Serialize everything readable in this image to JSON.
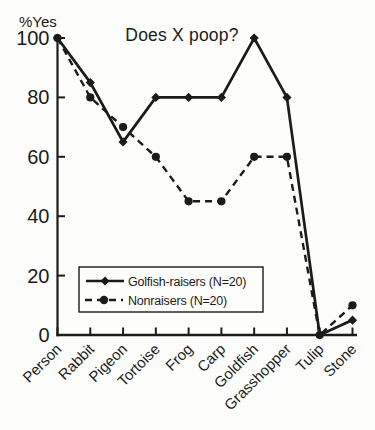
{
  "figure": {
    "title": "Does X poop?",
    "y_axis_unit": "%Yes"
  },
  "chart_data": {
    "type": "line",
    "title": "Does X poop?",
    "xlabel": "",
    "ylabel": "%Yes",
    "categories": [
      "Person",
      "Rabbit",
      "Pigeon",
      "Tortoise",
      "Frog",
      "Carp",
      "Goldfish",
      "Grasshopper",
      "Tulip",
      "Stone"
    ],
    "series": [
      {
        "name": "Golfish-raisers (N=20)",
        "line_style": "solid",
        "marker": "diamond",
        "values": [
          100,
          85,
          65,
          80,
          80,
          80,
          100,
          80,
          0,
          5
        ]
      },
      {
        "name": "Nonraisers (N=20)",
        "line_style": "dashed",
        "marker": "circle",
        "values": [
          100,
          80,
          70,
          60,
          45,
          45,
          60,
          60,
          0,
          10
        ]
      }
    ],
    "ylim": [
      0,
      100
    ],
    "yticks": [
      0,
      20,
      40,
      60,
      80,
      100
    ],
    "grid": false,
    "legend_position": "inside-lower-left",
    "colors": {
      "ink": "#1b1b1b",
      "background": "#fdfdfc",
      "legend_fill": "#fdfdfc"
    }
  }
}
